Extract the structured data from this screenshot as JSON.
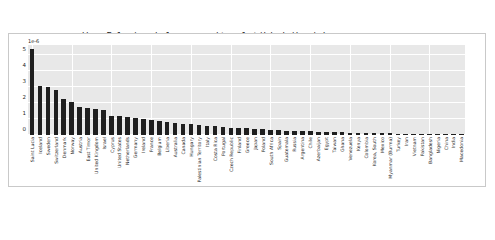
{
  "code": {
    "line1": "ascending=False).nobel_per_capita.plot(kind='bar',\\",
    "line2": "figsize=(12, 4))"
  },
  "chart_data": {
    "type": "bar",
    "title": "",
    "xlabel": "",
    "ylabel": "",
    "offset_text": "1e-6",
    "ylim": [
      0,
      5.6
    ],
    "yticks": [
      "0",
      "1",
      "2",
      "3",
      "4",
      "5"
    ],
    "ytick_values": [
      0,
      1,
      2,
      3,
      4,
      5
    ],
    "grid": true,
    "legend": false,
    "bar_color": "#1f1f1f",
    "axes_background": "#e8e8e8",
    "categories": [
      "Saint Lucia",
      "Iceland",
      "Sweden",
      "Switzerland",
      "Denmark",
      "Norway",
      "Austria",
      "East Timor",
      "United Kingdom",
      "Israel",
      "Cyprus",
      "United States",
      "Netherlands",
      "Germany",
      "Ireland",
      "France",
      "Belgium",
      "Liberia",
      "Australia",
      "Canada",
      "Hungary",
      "Palestinian Territory",
      "Italy",
      "Costa Rica",
      "Portugal",
      "Czech Republic",
      "Finland",
      "Greece",
      "Japan",
      "Poland",
      "South Africa",
      "Spain",
      "Guatemala",
      "Russia",
      "Argentina",
      "Chile",
      "Azerbaijan",
      "Egypt",
      "Taiwan",
      "Ghana",
      "Venezuela",
      "Kenya",
      "Colombia",
      "Korea, South",
      "Mexico",
      "Myanmar (Burma)",
      "Turkey",
      "Iran",
      "Vietnam",
      "Pakistan",
      "Bangladesh",
      "Nigeria",
      "China",
      "India",
      "Macedonia"
    ],
    "values": [
      5.35,
      3.02,
      2.98,
      2.82,
      2.24,
      2.08,
      1.74,
      1.7,
      1.64,
      1.58,
      1.2,
      1.16,
      1.12,
      1.04,
      1.0,
      0.94,
      0.86,
      0.8,
      0.74,
      0.7,
      0.66,
      0.62,
      0.58,
      0.54,
      0.5,
      0.46,
      0.44,
      0.41,
      0.38,
      0.35,
      0.32,
      0.3,
      0.28,
      0.26,
      0.24,
      0.22,
      0.2,
      0.19,
      0.17,
      0.16,
      0.15,
      0.14,
      0.13,
      0.12,
      0.11,
      0.1,
      0.09,
      0.08,
      0.07,
      0.06,
      0.05,
      0.04,
      0.03,
      0.02,
      0.02
    ],
    "value_scale": "1e-6"
  }
}
